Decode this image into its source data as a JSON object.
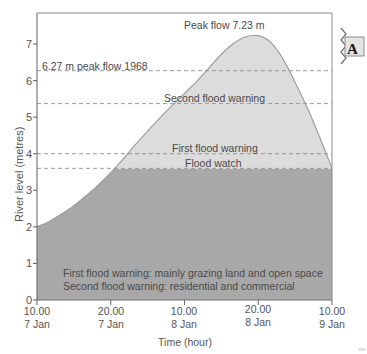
{
  "chart_data": {
    "type": "area",
    "title": "",
    "xlabel": "Time (hour)",
    "ylabel": "River level (metres)",
    "ylim": [
      0,
      7.6
    ],
    "yticks": [
      0,
      1,
      2,
      3,
      4,
      5,
      6,
      7
    ],
    "ytick_labels": [
      "0",
      "1",
      "2",
      "3",
      "4",
      "5",
      "6",
      "7"
    ],
    "xtick_labels": [
      {
        "time": "10.00",
        "date": "7 Jan"
      },
      {
        "time": "20.00",
        "date": "7 Jan"
      },
      {
        "time": "10.00",
        "date": "8 Jan"
      },
      {
        "time": "20.00",
        "date": "8 Jan"
      },
      {
        "time": "10.00",
        "date": "9 Jan"
      }
    ],
    "grid": false,
    "series": [
      {
        "name": "River level",
        "x": [
          0,
          2,
          4,
          6,
          8,
          10,
          12,
          14,
          16,
          18,
          20,
          22,
          24,
          26,
          28,
          30,
          32,
          34,
          36,
          38,
          40,
          42,
          44,
          46,
          48
        ],
        "values": [
          2.0,
          2.15,
          2.35,
          2.58,
          2.85,
          3.15,
          3.48,
          3.85,
          4.25,
          4.62,
          4.98,
          5.32,
          5.65,
          5.98,
          6.35,
          6.72,
          7.02,
          7.2,
          7.23,
          7.05,
          6.6,
          5.95,
          5.25,
          4.45,
          3.6
        ]
      }
    ],
    "peak": {
      "value": 7.23,
      "label": "Peak flow 7.23 m"
    },
    "reference_lines": [
      {
        "value": 6.27,
        "label": "6.27 m peak flow 1968"
      },
      {
        "value": 5.37,
        "label": "Second flood warning"
      },
      {
        "value": 4.0,
        "label": "First flood warning"
      },
      {
        "value": 3.6,
        "label": "Flood watch"
      }
    ],
    "fill_regions": [
      {
        "name": "above-flood-watch",
        "color": "#dcdcdc",
        "from": 3.6,
        "to": 7.23
      },
      {
        "name": "below-flood-watch",
        "color": "#a8a8a8",
        "from": 0,
        "to": 3.6
      }
    ],
    "annotations": [
      "First flood warning: mainly grazing land and open space",
      "Second flood warning: residential and commercial"
    ]
  },
  "figure": {
    "badge_label": "A",
    "corner_mark": "SRS"
  },
  "colors": {
    "fill_light": "#dcdcdc",
    "fill_dark": "#a8a8a8",
    "axis": "#6e6e6e",
    "dashed": "#8f8f8f",
    "text": "#555555",
    "curve": "#9a9a9a"
  }
}
